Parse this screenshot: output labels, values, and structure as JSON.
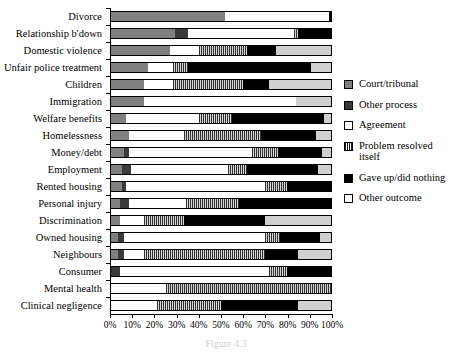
{
  "chart_data": {
    "type": "bar",
    "orientation": "horizontal",
    "stacked": true,
    "stack_percent": true,
    "title": "",
    "xlabel": "",
    "ylabel": "",
    "xlim": [
      0,
      100
    ],
    "grid": false,
    "legend_position": "right",
    "xticklabels": [
      "0%",
      "10%",
      "20%",
      "30%",
      "40%",
      "50%",
      "60%",
      "70%",
      "80%",
      "90%",
      "100%"
    ],
    "xticks": [
      0,
      10,
      20,
      30,
      40,
      50,
      60,
      70,
      80,
      90,
      100
    ],
    "categories": [
      "Divorce",
      "Relationship b'down",
      "Domestic violence",
      "Unfair police treatment",
      "Children",
      "Immigration",
      "Welfare benefits",
      "Homelessness",
      "Money/debt",
      "Employment",
      "Rented housing",
      "Personal injury",
      "Discrimination",
      "Owned housing",
      "Neighbours",
      "Consumer",
      "Mental health",
      "Clinical negligence"
    ],
    "series": [
      {
        "name": "Court/tribunal",
        "key": "court",
        "color": "#808080",
        "values": [
          52,
          29,
          27,
          17,
          15,
          15,
          7,
          8,
          6,
          5,
          5,
          4,
          4,
          3,
          3,
          0,
          0,
          0
        ]
      },
      {
        "name": "Other process",
        "key": "other-process",
        "color": "#3a3a3a",
        "values": [
          0,
          6,
          0,
          0,
          0,
          0,
          0,
          0,
          2,
          4,
          2,
          4,
          0,
          3,
          3,
          4,
          0,
          0
        ]
      },
      {
        "name": "Agreement",
        "key": "agreement",
        "color": "#ffffff",
        "values": [
          47,
          48,
          13,
          11,
          13,
          69,
          33,
          25,
          56,
          44,
          63,
          26,
          11,
          64,
          9,
          68,
          25,
          21
        ]
      },
      {
        "name": "Problem resolved itself",
        "key": "resolved",
        "color": "#8a8a8a",
        "values": [
          0,
          2,
          22,
          7,
          32,
          0,
          15,
          35,
          12,
          9,
          10,
          24,
          18,
          7,
          55,
          8,
          75,
          29
        ]
      },
      {
        "name": "Gave up/did nothing",
        "key": "gaveup",
        "color": "#000000",
        "values": [
          1,
          15,
          13,
          56,
          12,
          0,
          42,
          25,
          20,
          32,
          20,
          42,
          37,
          18,
          15,
          20,
          0,
          35
        ]
      },
      {
        "name": "Other outcome",
        "key": "other-outcome",
        "color": "#d0d0d0",
        "values": [
          0,
          0,
          25,
          9,
          28,
          16,
          3,
          7,
          4,
          6,
          0,
          0,
          30,
          5,
          15,
          0,
          0,
          15
        ]
      }
    ]
  },
  "legend": {
    "items": [
      {
        "label": "Court/tribunal",
        "key": "court"
      },
      {
        "label": "Other process",
        "key": "other-process"
      },
      {
        "label": "Agreement",
        "key": "agreement"
      },
      {
        "label": "Problem resolved itself",
        "key": "resolved"
      },
      {
        "label": "Gave up/did nothing",
        "key": "gaveup"
      },
      {
        "label": "Other outcome",
        "key": "other-outcome"
      }
    ]
  },
  "caption": "Figure 4.3"
}
